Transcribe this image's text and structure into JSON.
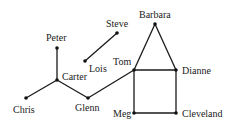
{
  "diagram": {
    "type": "graph",
    "nodes": [
      {
        "id": "peter",
        "label": "Peter",
        "x": 57,
        "y": 48,
        "lx": 46,
        "ly": 41
      },
      {
        "id": "carter",
        "label": "Carter",
        "x": 57,
        "y": 80,
        "lx": 62,
        "ly": 80
      },
      {
        "id": "chris",
        "label": "Chris",
        "x": 26,
        "y": 98,
        "lx": 13,
        "ly": 113
      },
      {
        "id": "glenn",
        "label": "Glenn",
        "x": 88,
        "y": 98,
        "lx": 75,
        "ly": 111
      },
      {
        "id": "lois",
        "label": "Lois",
        "x": 85,
        "y": 61,
        "lx": 89,
        "ly": 72
      },
      {
        "id": "steve",
        "label": "Steve",
        "x": 117,
        "y": 33,
        "lx": 106,
        "ly": 27
      },
      {
        "id": "tom",
        "label": "Tom",
        "x": 134,
        "y": 70,
        "lx": 113,
        "ly": 65
      },
      {
        "id": "barbara",
        "label": "Barbara",
        "x": 155,
        "y": 24,
        "lx": 139,
        "ly": 18
      },
      {
        "id": "dianne",
        "label": "Dianne",
        "x": 176,
        "y": 70,
        "lx": 182,
        "ly": 74
      },
      {
        "id": "meg",
        "label": "Meg",
        "x": 134,
        "y": 113,
        "lx": 113,
        "ly": 117
      },
      {
        "id": "cleveland",
        "label": "Cleveland",
        "x": 176,
        "y": 113,
        "lx": 182,
        "ly": 117
      }
    ],
    "edges": [
      [
        "peter",
        "carter"
      ],
      [
        "carter",
        "chris"
      ],
      [
        "carter",
        "glenn"
      ],
      [
        "glenn",
        "tom"
      ],
      [
        "lois",
        "steve"
      ],
      [
        "tom",
        "barbara"
      ],
      [
        "barbara",
        "dianne"
      ],
      [
        "tom",
        "dianne"
      ],
      [
        "tom",
        "meg"
      ],
      [
        "dianne",
        "cleveland"
      ],
      [
        "meg",
        "cleveland"
      ]
    ],
    "colors": {
      "edge": "#1a1a1a",
      "node": "#111111",
      "background": "#ffffff"
    }
  }
}
